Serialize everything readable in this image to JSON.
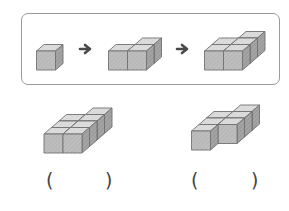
{
  "sequence_box": {
    "steps": [
      {
        "label": "step-1",
        "cubes": [
          [
            0,
            0,
            0
          ]
        ]
      },
      {
        "label": "step-2",
        "cubes": [
          [
            0,
            0,
            0
          ],
          [
            1,
            0,
            0
          ],
          [
            1,
            1,
            0
          ]
        ]
      },
      {
        "label": "step-3",
        "cubes": [
          [
            0,
            0,
            0
          ],
          [
            1,
            0,
            0
          ],
          [
            0,
            1,
            0
          ],
          [
            1,
            1,
            0
          ],
          [
            1,
            2,
            0
          ]
        ]
      }
    ],
    "arrow_glyph": "➜"
  },
  "answers": [
    {
      "label": "option-a",
      "cubes": [
        [
          0,
          0,
          0
        ],
        [
          1,
          0,
          0
        ],
        [
          0,
          1,
          0
        ],
        [
          1,
          1,
          0
        ],
        [
          0,
          2,
          0
        ],
        [
          1,
          2,
          0
        ],
        [
          1,
          3,
          0
        ]
      ],
      "open_paren": "(",
      "close_paren": ")"
    },
    {
      "label": "option-b",
      "cubes": [
        [
          0,
          0,
          0
        ],
        [
          0,
          1,
          0
        ],
        [
          1,
          1,
          0
        ],
        [
          0,
          2,
          0
        ],
        [
          1,
          2,
          0
        ],
        [
          1,
          3,
          0
        ]
      ],
      "open_paren": "(",
      "close_paren": ")"
    }
  ],
  "colors": {
    "front": "#b8b8b8",
    "top": "#d9d9d9",
    "side": "#9c9c9c",
    "edge": "#6e6e6e",
    "arrow": "#4a4a4a",
    "border": "#9a9a9a"
  }
}
